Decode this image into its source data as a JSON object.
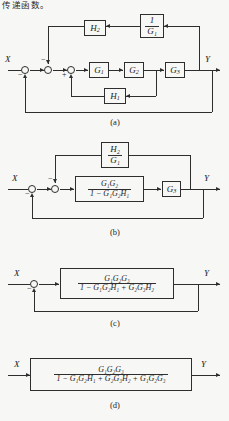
{
  "page": {
    "header_text": "传递函数。",
    "background_color": "#f7f7f5",
    "ink_color": "#2e2e2e"
  },
  "symbols": {
    "input": "X",
    "output": "Y",
    "minus": "−",
    "plus": "+"
  },
  "diagrams": [
    {
      "id": "a",
      "caption": "(a)",
      "input_label": "X",
      "output_label": "Y",
      "blocks": [
        {
          "name": "H2",
          "text": "H",
          "sub": "2",
          "kind": "simple"
        },
        {
          "name": "one-over-G1",
          "numerator": "1",
          "denominator": "G₁",
          "kind": "fraction"
        },
        {
          "name": "G1",
          "text": "G",
          "sub": "1",
          "kind": "simple"
        },
        {
          "name": "G2",
          "text": "G",
          "sub": "2",
          "kind": "simple"
        },
        {
          "name": "G3",
          "text": "G",
          "sub": "3",
          "kind": "simple"
        },
        {
          "name": "H1",
          "text": "H",
          "sub": "1",
          "kind": "simple"
        }
      ],
      "summing_junctions": [
        {
          "name": "sum-1",
          "signs": [
            "−"
          ]
        },
        {
          "name": "sum-2",
          "signs": [
            "−"
          ]
        },
        {
          "name": "sum-3",
          "signs": [
            "+"
          ]
        }
      ]
    },
    {
      "id": "b",
      "caption": "(b)",
      "input_label": "X",
      "output_label": "Y",
      "blocks": [
        {
          "name": "H2-over-G1",
          "numerator": "H₂",
          "denominator": "G₁",
          "kind": "fraction"
        },
        {
          "name": "inner-loop-tf",
          "numerator": "G₁G₂",
          "denominator": "1 − G₁G₂H₁",
          "kind": "fraction"
        },
        {
          "name": "G3",
          "text": "G",
          "sub": "3",
          "kind": "simple"
        }
      ],
      "summing_junctions": [
        {
          "name": "sum-1",
          "signs": [
            "−"
          ]
        },
        {
          "name": "sum-2",
          "signs": [
            "−"
          ]
        }
      ]
    },
    {
      "id": "c",
      "caption": "(c)",
      "input_label": "X",
      "output_label": "Y",
      "blocks": [
        {
          "name": "combined-tf",
          "numerator": "G₁G₂G₃",
          "denominator": "1 − G₁G₂H₁ + G₂G₃H₂",
          "kind": "fraction"
        }
      ],
      "summing_junctions": [
        {
          "name": "sum-1",
          "signs": [
            "−"
          ]
        }
      ]
    },
    {
      "id": "d",
      "caption": "(d)",
      "input_label": "X",
      "output_label": "Y",
      "blocks": [
        {
          "name": "overall-tf",
          "numerator": "G₁G₂G₃",
          "denominator": "1 − G₁G₂H₁ + G₂G₃H₂ + G₁G₂G₃",
          "kind": "fraction"
        }
      ],
      "summing_junctions": []
    }
  ]
}
